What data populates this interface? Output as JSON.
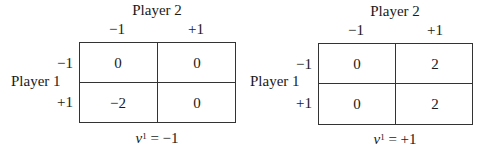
{
  "games": [
    {
      "player2_label": "Player 2",
      "player1_label": "Player 1",
      "col_headers": [
        "−1",
        "+1"
      ],
      "row_headers": [
        "−1",
        "+1"
      ],
      "payoffs": [
        [
          "0",
          "0"
        ],
        [
          "−2",
          "0"
        ]
      ],
      "caption": {
        "var": "v",
        "sup": "1",
        "eq": " = −1"
      }
    },
    {
      "player2_label": "Player 2",
      "player1_label": "Player 1",
      "col_headers": [
        "−1",
        "+1"
      ],
      "row_headers": [
        "−1",
        "+1"
      ],
      "payoffs": [
        [
          "0",
          "2"
        ],
        [
          "0",
          "2"
        ]
      ],
      "caption": {
        "var": "v",
        "sup": "1",
        "eq": " = +1"
      }
    }
  ]
}
